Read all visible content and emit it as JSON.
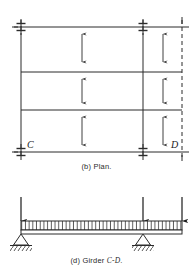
{
  "figure": {
    "panel_plan": {
      "caption_prefix": "(b)",
      "caption_text": "(b) Plan.",
      "grid_labels": [
        {
          "name": "column-label-c",
          "text": "C",
          "x": 28,
          "y": 147
        },
        {
          "name": "column-label-d",
          "text": "D",
          "x": 172,
          "y": 147
        }
      ],
      "column_lines_vertical": [
        {
          "name": "grid-line-left",
          "x": 21,
          "y1": 20,
          "y2": 158,
          "style": "solid"
        },
        {
          "name": "grid-line-middle",
          "x": 143,
          "y1": 20,
          "y2": 158,
          "style": "solid"
        },
        {
          "name": "grid-line-right",
          "x": 182,
          "y1": 20,
          "y2": 158,
          "style": "dashed"
        }
      ],
      "beam_lines_horizontal": [
        {
          "name": "beam-line-top",
          "y": 27,
          "x1": 12,
          "x2": 189
        },
        {
          "name": "beam-line-second",
          "y": 72,
          "x1": 21,
          "x2": 182
        },
        {
          "name": "beam-line-third",
          "y": 110,
          "x1": 21,
          "x2": 182
        },
        {
          "name": "beam-line-bottom",
          "y": 152,
          "x1": 12,
          "x2": 189
        }
      ],
      "column_symbols": [
        {
          "name": "column-symbol-top-left",
          "x": 21,
          "y": 27
        },
        {
          "name": "column-symbol-top-middle",
          "x": 143,
          "y": 27
        },
        {
          "name": "column-symbol-bottom-left",
          "x": 21,
          "y": 152
        },
        {
          "name": "column-symbol-bottom-middle",
          "x": 143,
          "y": 152
        }
      ],
      "load_direction_arrows": [
        {
          "name": "slab-load-arrow-bay1-panel1",
          "x": 82,
          "y1": 34,
          "y2": 62
        },
        {
          "name": "slab-load-arrow-bay1-panel2",
          "x": 82,
          "y1": 78,
          "y2": 101
        },
        {
          "name": "slab-load-arrow-bay1-panel3",
          "x": 82,
          "y1": 116,
          "y2": 145
        },
        {
          "name": "slab-load-arrow-bay2-panel1",
          "x": 163,
          "y1": 34,
          "y2": 62
        },
        {
          "name": "slab-load-arrow-bay2-panel2",
          "x": 163,
          "y1": 78,
          "y2": 101
        },
        {
          "name": "slab-load-arrow-bay2-panel3",
          "x": 163,
          "y1": 116,
          "y2": 145
        }
      ]
    },
    "panel_girder": {
      "caption_prefix": "(d)",
      "caption_word": "Girder",
      "caption_member": "C-D",
      "caption_text": "(d) Girder C-D.",
      "beam": {
        "name": "girder-beam",
        "x1": 21,
        "x2": 182,
        "y_top": 221,
        "y_bottom": 232
      },
      "distributed_load_band": {
        "name": "uniform-load-band",
        "x1": 21,
        "x2": 182,
        "y_top": 221,
        "y_bottom": 229,
        "tick_count": 43
      },
      "point_loads": [
        {
          "name": "point-load-arrow-left",
          "x": 21,
          "y_start": 197,
          "y_end": 221
        },
        {
          "name": "point-load-arrow-middle",
          "x": 143,
          "y_start": 197,
          "y_end": 221
        },
        {
          "name": "point-load-arrow-right",
          "x": 182,
          "y_start": 197,
          "y_end": 221
        }
      ],
      "supports": [
        {
          "name": "pin-support-left",
          "x": 21,
          "y": 232,
          "width": 16,
          "height": 10
        },
        {
          "name": "pin-support-right",
          "x": 143,
          "y": 232,
          "width": 16,
          "height": 10
        }
      ]
    }
  },
  "colors": {
    "ink": "#1a1a1a",
    "line": "#2b2b2b",
    "background": "#ffffff"
  }
}
